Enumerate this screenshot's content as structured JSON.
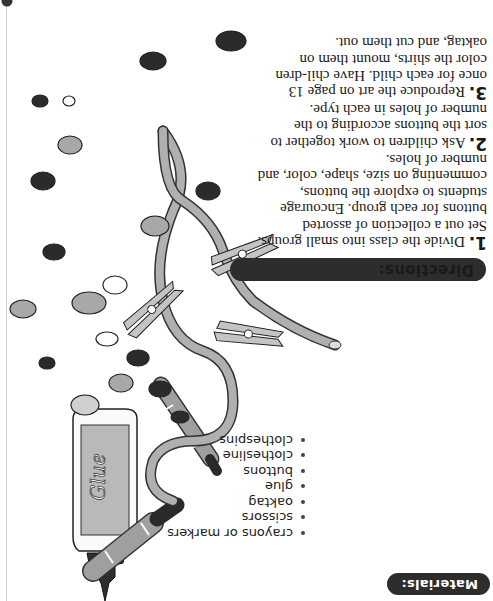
{
  "orientation": "rotated-180",
  "materials": {
    "heading": "Materials:",
    "items": [
      "crayons or markers",
      "scissors",
      "oaktag",
      "glue",
      "buttons",
      "clothesline",
      "clothespins"
    ]
  },
  "directions": {
    "heading": "Directions:",
    "steps": [
      {
        "number": "1.",
        "text": "Divide the class into small groups.  Set out a collection of assorted buttons for each group. Encourage students to explore the buttons, commenting on size, shape, color, and number of holes."
      },
      {
        "number": "2.",
        "text": "Ask children to work together to sort the buttons according to the number of holes in each type."
      },
      {
        "number": "3.",
        "text": "Reproduce the art on page 13 once for each child.  Have chil-dren color the shirts, mount them on oaktag, and cut them out."
      }
    ]
  },
  "illustration": {
    "glue_label": "Glue",
    "objects": [
      "glue-bottle",
      "marker",
      "crayon",
      "clothesline",
      "clothespin",
      "clothespin",
      "clothespin",
      "buttons"
    ]
  },
  "colors": {
    "pill_bg": "#2d2d2d",
    "pill_text": "#ffffff",
    "line_gray": "#a9a9a9",
    "button_dark": "#2b2b2b",
    "button_mid": "#a8a8a8",
    "button_light": "#ffffff"
  }
}
